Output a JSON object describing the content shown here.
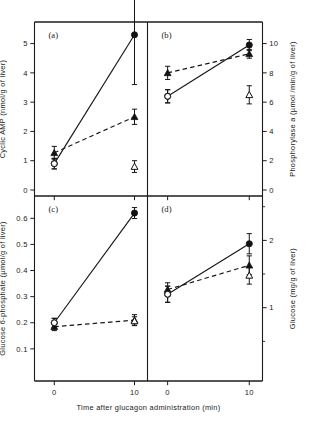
{
  "figure": {
    "xlabel": "Time after glucagon administration (min)",
    "panels": [
      {
        "id": "a",
        "label": "(a)",
        "ylabel": "Cyclic AMP (nmol/g of liver)",
        "yaxis_side": "left",
        "ylim": [
          0,
          5.6
        ],
        "yticks": [
          0,
          1,
          2,
          3,
          4,
          5
        ],
        "yticklabels": [
          "0",
          "1",
          "2",
          "3",
          "4",
          "5"
        ],
        "xticks": [
          0,
          10
        ],
        "xticklabels": [
          "0",
          "10"
        ],
        "series": [
          {
            "name": "filled-circle-solid",
            "marker": "filled-circle",
            "line": "solid",
            "x": [
              0,
              10
            ],
            "y": [
              0.9,
              5.3
            ],
            "yerr": [
              0.18,
              1.7
            ]
          },
          {
            "name": "filled-triangle-dashed",
            "marker": "filled-triangle",
            "line": "dashed",
            "x": [
              0,
              10
            ],
            "y": [
              1.27,
              2.5
            ],
            "yerr": [
              0.22,
              0.26
            ]
          },
          {
            "name": "open-triangle",
            "marker": "open-triangle",
            "line": "none",
            "x": [
              10
            ],
            "y": [
              0.8
            ],
            "yerr": [
              0.2
            ]
          },
          {
            "name": "open-circle",
            "marker": "open-circle",
            "line": "none",
            "x": [
              0
            ],
            "y": [
              0.9
            ],
            "yerr": [
              0.18
            ]
          }
        ]
      },
      {
        "id": "b",
        "label": "(b)",
        "ylabel": "Phosphorylase a (µmol /min/g of liver)",
        "yaxis_side": "right",
        "ylim": [
          0,
          11.2
        ],
        "yticks": [
          0,
          2,
          4,
          6,
          8,
          10
        ],
        "yticklabels": [
          "0",
          "2",
          "4",
          "6",
          "8",
          "10"
        ],
        "xticks": [
          0,
          10
        ],
        "xticklabels": [
          "0",
          "10"
        ],
        "series": [
          {
            "name": "filled-circle-solid",
            "marker": "filled-circle",
            "line": "solid",
            "x": [
              0,
              10
            ],
            "y": [
              6.4,
              9.9
            ],
            "yerr": [
              0.45,
              0.38
            ]
          },
          {
            "name": "filled-triangle-dashed",
            "marker": "filled-triangle",
            "line": "dashed",
            "x": [
              0,
              10
            ],
            "y": [
              8.0,
              9.3
            ],
            "yerr": [
              0.45,
              0.3
            ]
          },
          {
            "name": "open-triangle",
            "marker": "open-triangle",
            "line": "none",
            "x": [
              10
            ],
            "y": [
              6.5
            ],
            "yerr": [
              0.62
            ]
          },
          {
            "name": "open-circle",
            "marker": "open-circle",
            "line": "none",
            "x": [
              0
            ],
            "y": [
              6.4
            ],
            "yerr": [
              0.45
            ]
          }
        ]
      },
      {
        "id": "c",
        "label": "(c)",
        "ylabel": "Glucose 6-phosphate (µmol/g of liver)",
        "yaxis_side": "left",
        "ylim": [
          0,
          0.67
        ],
        "yticks": [
          0.1,
          0.2,
          0.3,
          0.4,
          0.5,
          0.6
        ],
        "yticklabels": [
          "0.1",
          "0.2",
          "0.3",
          "0.4",
          "0.5",
          "0.6"
        ],
        "xticks": [
          0,
          10
        ],
        "xticklabels": [
          "0",
          "10"
        ],
        "series": [
          {
            "name": "filled-circle-solid",
            "marker": "filled-circle",
            "line": "solid",
            "x": [
              0,
              10
            ],
            "y": [
              0.2,
              0.62
            ],
            "yerr": [
              0.017,
              0.021
            ]
          },
          {
            "name": "filled-triangle-dashed",
            "marker": "filled-triangle",
            "line": "dashed",
            "x": [
              0,
              10
            ],
            "y": [
              0.185,
              0.21
            ],
            "yerr": [
              0.015,
              0.021
            ]
          },
          {
            "name": "open-triangle",
            "marker": "open-triangle",
            "line": "none",
            "x": [
              10
            ],
            "y": [
              0.207
            ],
            "yerr": [
              0.016
            ]
          },
          {
            "name": "open-circle",
            "marker": "open-circle",
            "line": "none",
            "x": [
              0
            ],
            "y": [
              0.2
            ],
            "yerr": [
              0.017
            ]
          }
        ]
      },
      {
        "id": "d",
        "label": "(d)",
        "ylabel": "Glucose (mg/g of liver)",
        "yaxis_side": "right",
        "ylim": [
          0,
          2.6
        ],
        "yticks": [
          1,
          2
        ],
        "yticklabels": [
          "1",
          "2"
        ],
        "yticks_minor": [
          0.5,
          1.5,
          2.5
        ],
        "xticks": [
          0,
          10
        ],
        "xticklabels": [
          "0",
          "10"
        ],
        "series": [
          {
            "name": "filled-circle-solid",
            "marker": "filled-circle",
            "line": "solid",
            "x": [
              0,
              10
            ],
            "y": [
              1.2,
              1.95
            ],
            "yerr": [
              0.12,
              0.15
            ]
          },
          {
            "name": "filled-triangle-dashed",
            "marker": "filled-triangle",
            "line": "dashed",
            "x": [
              0,
              10
            ],
            "y": [
              1.27,
              1.63
            ],
            "yerr": [
              0.1,
              0.14
            ]
          },
          {
            "name": "open-triangle",
            "marker": "open-triangle",
            "line": "none",
            "x": [
              10
            ],
            "y": [
              1.48
            ],
            "yerr": [
              0.13
            ]
          },
          {
            "name": "open-circle",
            "marker": "open-circle",
            "line": "none",
            "x": [
              0
            ],
            "y": [
              1.2
            ],
            "yerr": [
              0.12
            ]
          }
        ]
      }
    ]
  },
  "chart_data": {
    "type": "line",
    "title": "",
    "xlabel": "Time after glucagon administration (min)",
    "x": [
      0,
      10
    ],
    "panels": [
      {
        "panel": "(a)",
        "ylabel": "Cyclic AMP (nmol/g of liver)",
        "ylim": [
          0,
          5.6
        ],
        "yticks": [
          0,
          1,
          2,
          3,
          4,
          5
        ],
        "grid": false,
        "series": [
          {
            "name": "filled-circle-solid",
            "values": [
              0.9,
              5.3
            ],
            "errors": [
              0.18,
              1.7
            ]
          },
          {
            "name": "filled-triangle-dashed",
            "values": [
              1.27,
              2.5
            ],
            "errors": [
              0.22,
              0.26
            ]
          },
          {
            "name": "open-circle",
            "values": [
              0.9,
              null
            ],
            "errors": [
              0.18,
              null
            ]
          },
          {
            "name": "open-triangle",
            "values": [
              null,
              0.8
            ],
            "errors": [
              null,
              0.2
            ]
          }
        ]
      },
      {
        "panel": "(b)",
        "ylabel": "Phosphorylase a (µmol/min/g of liver)",
        "ylim": [
          0,
          11.2
        ],
        "yticks": [
          0,
          2,
          4,
          6,
          8,
          10
        ],
        "grid": false,
        "series": [
          {
            "name": "filled-circle-solid",
            "values": [
              6.4,
              9.9
            ],
            "errors": [
              0.45,
              0.38
            ]
          },
          {
            "name": "filled-triangle-dashed",
            "values": [
              8.0,
              9.3
            ],
            "errors": [
              0.45,
              0.3
            ]
          },
          {
            "name": "open-circle",
            "values": [
              6.4,
              null
            ],
            "errors": [
              0.45,
              null
            ]
          },
          {
            "name": "open-triangle",
            "values": [
              8.0,
              6.5
            ],
            "errors": [
              0.45,
              0.62
            ]
          }
        ]
      },
      {
        "panel": "(c)",
        "ylabel": "Glucose 6-phosphate (µmol/g of liver)",
        "ylim": [
          0,
          0.67
        ],
        "yticks": [
          0.1,
          0.2,
          0.3,
          0.4,
          0.5,
          0.6
        ],
        "grid": false,
        "series": [
          {
            "name": "filled-circle-solid",
            "values": [
              0.2,
              0.62
            ],
            "errors": [
              0.017,
              0.021
            ]
          },
          {
            "name": "filled-triangle-dashed",
            "values": [
              0.185,
              0.21
            ],
            "errors": [
              0.015,
              0.021
            ]
          },
          {
            "name": "open-circle",
            "values": [
              0.2,
              null
            ],
            "errors": [
              0.017,
              null
            ]
          },
          {
            "name": "open-triangle",
            "values": [
              0.185,
              0.207
            ],
            "errors": [
              0.015,
              0.016
            ]
          }
        ]
      },
      {
        "panel": "(d)",
        "ylabel": "Glucose (mg/g of liver)",
        "ylim": [
          0,
          2.6
        ],
        "yticks": [
          1,
          2
        ],
        "grid": false,
        "series": [
          {
            "name": "filled-circle-solid",
            "values": [
              1.2,
              1.95
            ],
            "errors": [
              0.12,
              0.15
            ]
          },
          {
            "name": "filled-triangle-dashed",
            "values": [
              1.27,
              1.63
            ],
            "errors": [
              0.1,
              0.14
            ]
          },
          {
            "name": "open-circle",
            "values": [
              1.2,
              null
            ],
            "errors": [
              0.12,
              null
            ]
          },
          {
            "name": "open-triangle",
            "values": [
              1.27,
              1.48
            ],
            "errors": [
              0.1,
              0.13
            ]
          }
        ]
      }
    ]
  }
}
